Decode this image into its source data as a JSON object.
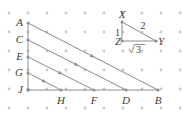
{
  "figure": {
    "background_color": "#ffffff",
    "line_color": "#8c8c8c",
    "dot_color": "#c9c9c9",
    "label_color": "#3a3a3a"
  },
  "grid": {
    "type": "dot-grid",
    "spacing_px": 19,
    "origin_x": 9,
    "origin_y": 13,
    "cols": 10,
    "rows": 6,
    "dot_radius": 1.4
  },
  "large_triangle": {
    "name": "triangle-ABJ",
    "vertices": {
      "A": {
        "label": "A",
        "x": 28,
        "y": 23
      },
      "J": {
        "label": "J",
        "x": 28,
        "y": 90
      },
      "B": {
        "label": "B",
        "x": 158,
        "y": 90
      }
    },
    "left_side_points": [
      {
        "label": "A",
        "x": 28,
        "y": 23
      },
      {
        "label": "C",
        "x": 28,
        "y": 40
      },
      {
        "label": "E",
        "x": 28,
        "y": 57
      },
      {
        "label": "G",
        "x": 28,
        "y": 73
      },
      {
        "label": "J",
        "x": 28,
        "y": 90
      }
    ],
    "bottom_side_points": [
      {
        "label": "J",
        "x": 28,
        "y": 90
      },
      {
        "label": "H",
        "x": 61,
        "y": 90
      },
      {
        "label": "F",
        "x": 94,
        "y": 90
      },
      {
        "label": "D",
        "x": 126,
        "y": 90
      },
      {
        "label": "B",
        "x": 158,
        "y": 90
      }
    ],
    "parallel_segments": [
      {
        "name": "segment-AB",
        "from": "A",
        "to": "B",
        "x1": 28,
        "y1": 23,
        "x2": 158,
        "y2": 90
      },
      {
        "name": "segment-CD",
        "from": "C",
        "to": "D",
        "x1": 28,
        "y1": 40,
        "x2": 126,
        "y2": 90
      },
      {
        "name": "segment-EF",
        "from": "E",
        "to": "F",
        "x1": 28,
        "y1": 57,
        "x2": 94,
        "y2": 90
      },
      {
        "name": "segment-GH",
        "from": "G",
        "to": "H",
        "x1": 28,
        "y1": 73,
        "x2": 61,
        "y2": 90
      }
    ]
  },
  "reference_triangle": {
    "name": "triangle-XYZ",
    "vertices": {
      "X": {
        "label": "X",
        "x": 122,
        "y": 22
      },
      "Z": {
        "label": "Z",
        "x": 122,
        "y": 41
      },
      "Y": {
        "label": "Y",
        "x": 156,
        "y": 41
      }
    },
    "side_labels": {
      "leg_vertical": "1",
      "hypotenuse": "2",
      "leg_horizontal_radical": "3",
      "leg_horizontal_display": "√3"
    }
  }
}
